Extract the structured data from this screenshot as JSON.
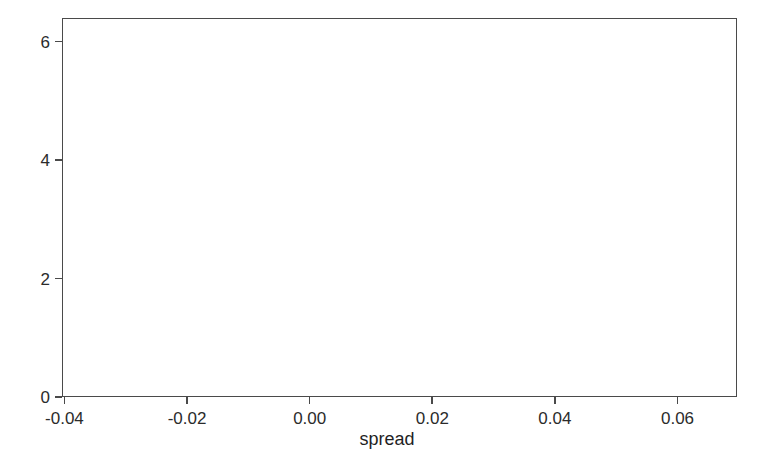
{
  "chart_data": {
    "type": "bar",
    "title": "",
    "subtitle": "",
    "xlabel": "spread",
    "ylabel": "",
    "xlim": [
      -0.0404,
      0.0697
    ],
    "ylim": [
      0,
      6.4
    ],
    "grid": true,
    "legend": false,
    "legend_position": "none",
    "bar_color": "#333333",
    "bin_width": 0.0103,
    "xticks": [
      -0.04,
      -0.02,
      0.0,
      0.02,
      0.04,
      0.06
    ],
    "xtick_labels": [
      "-0.04",
      "-0.02",
      "0.00",
      "0.02",
      "0.04",
      "0.06"
    ],
    "yticks": [
      0,
      2,
      4,
      6
    ],
    "ytick_labels": [
      "0",
      "2",
      "4",
      "6"
    ],
    "bins": [
      {
        "left": -0.0344,
        "right": -0.0241,
        "count": 1
      },
      {
        "left": -0.0241,
        "right": -0.0138,
        "count": 1
      },
      {
        "left": -0.0138,
        "right": -0.0035,
        "count": 0
      },
      {
        "left": -0.0035,
        "right": 0.0068,
        "count": 0
      },
      {
        "left": 0.0068,
        "right": 0.0171,
        "count": 1
      },
      {
        "left": 0.0171,
        "right": 0.0274,
        "count": 0
      },
      {
        "left": 0.0274,
        "right": 0.0377,
        "count": 4
      },
      {
        "left": 0.0377,
        "right": 0.048,
        "count": 6
      },
      {
        "left": 0.048,
        "right": 0.0583,
        "count": 1
      },
      {
        "left": 0.0583,
        "right": 0.0686,
        "count": 1
      }
    ],
    "categories": [
      "-0.0344..-0.0241",
      "-0.0241..-0.0138",
      "-0.0138..-0.0035",
      "-0.0035..0.0068",
      "0.0068..0.0171",
      "0.0171..0.0274",
      "0.0274..0.0377",
      "0.0377..0.0480",
      "0.0480..0.0583",
      "0.0583..0.0686"
    ],
    "values": [
      1,
      1,
      0,
      0,
      1,
      0,
      4,
      6,
      1,
      1
    ]
  },
  "axes": {
    "frame_color": "#4a4a4a",
    "grid_color": "#f0f0f0"
  }
}
